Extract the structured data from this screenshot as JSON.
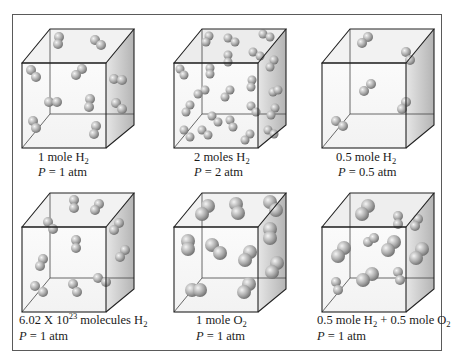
{
  "figure": {
    "panels": [
      {
        "id": "panel-1",
        "amount_text": "1 mole H",
        "amount_sub": "2",
        "pressure_var": "P",
        "pressure_text": " = 1 atm",
        "molecule_type": "H2",
        "molecule_count": 13
      },
      {
        "id": "panel-2",
        "amount_text": "2 moles H",
        "amount_sub": "2",
        "pressure_var": "P",
        "pressure_text": " = 2 atm",
        "molecule_type": "H2",
        "molecule_count": 26
      },
      {
        "id": "panel-3",
        "amount_text": "0.5 mole H",
        "amount_sub": "2",
        "pressure_var": "P",
        "pressure_text": " = 0.5 atm",
        "molecule_type": "H2",
        "molecule_count": 6
      },
      {
        "id": "panel-4",
        "amount_prefix": "6.02 X 10",
        "amount_sup": "23",
        "amount_text": " molecules H",
        "amount_sub": "2",
        "pressure_var": "P",
        "pressure_text": " = 1 atm",
        "molecule_type": "H2",
        "molecule_count": 13
      },
      {
        "id": "panel-5",
        "amount_text": "1 mole O",
        "amount_sub": "2",
        "pressure_var": "P",
        "pressure_text": " = 1 atm",
        "molecule_type": "O2",
        "molecule_count": 12
      },
      {
        "id": "panel-6",
        "amount_text": "0.5 mole H",
        "amount_sub": "2",
        "amount_mid": " + 0.5 mole O",
        "amount_sub2": "2",
        "pressure_var": "P",
        "pressure_text": " = 1 atm",
        "molecule_type": "H2 + O2",
        "molecule_count": 13
      }
    ]
  },
  "colors": {
    "frame": "#5a5a5a",
    "cube_edge": "#2a2a2a",
    "molecule": "#9a9a9a"
  }
}
